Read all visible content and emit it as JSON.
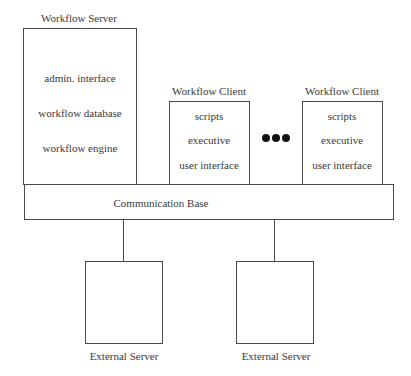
{
  "diagram": {
    "workflow_server": {
      "title": "Workflow Server",
      "components": [
        "admin. interface",
        "workflow database",
        "workflow engine"
      ]
    },
    "workflow_clients": [
      {
        "title": "Workflow Client",
        "components": [
          "scripts",
          "executive",
          "user interface"
        ]
      },
      {
        "title": "Workflow Client",
        "components": [
          "scripts",
          "executive",
          "user interface"
        ]
      }
    ],
    "ellipsis": "•••",
    "communication_base": {
      "label": "Communication Base"
    },
    "external_servers": [
      {
        "label": "External Server"
      },
      {
        "label": "External Server"
      }
    ]
  }
}
